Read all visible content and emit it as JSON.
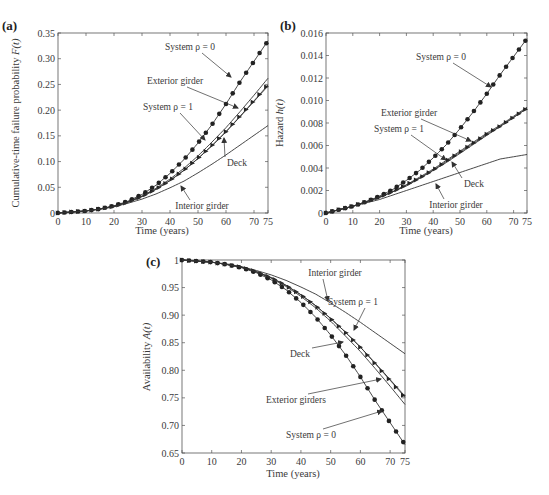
{
  "chart_data": [
    {
      "id": "a",
      "panel_label": "(a)",
      "type": "line",
      "title": "",
      "xlabel": "Time (years)",
      "ylabel": "Cumulative-time failure probability F(t)",
      "xlim": [
        0,
        75
      ],
      "ylim": [
        0,
        0.35
      ],
      "xticks": [
        0,
        10,
        20,
        30,
        40,
        50,
        60,
        70,
        75
      ],
      "yticks": [
        0,
        0.05,
        0.1,
        0.15,
        0.2,
        0.25,
        0.3,
        0.35
      ],
      "ytick_labels": [
        "0",
        "0.05",
        "0.10",
        "0.15",
        "0.20",
        "0.25",
        "0.30",
        "0.35"
      ],
      "grid": false,
      "x": [
        0,
        5,
        10,
        15,
        20,
        25,
        30,
        35,
        40,
        45,
        50,
        55,
        60,
        65,
        70,
        75
      ],
      "series": [
        {
          "name": "System ρ = 0",
          "marker": "circle",
          "values": [
            0,
            0.002,
            0.004,
            0.008,
            0.014,
            0.023,
            0.036,
            0.054,
            0.077,
            0.104,
            0.136,
            0.172,
            0.212,
            0.255,
            0.295,
            0.335
          ]
        },
        {
          "name": "Exterior girder",
          "marker": "none",
          "values": [
            0,
            0.002,
            0.004,
            0.008,
            0.013,
            0.022,
            0.033,
            0.048,
            0.066,
            0.087,
            0.111,
            0.138,
            0.166,
            0.197,
            0.229,
            0.262
          ]
        },
        {
          "name": "System ρ = 1",
          "marker": "triangle",
          "values": [
            0,
            0.002,
            0.004,
            0.008,
            0.013,
            0.021,
            0.032,
            0.046,
            0.063,
            0.083,
            0.106,
            0.131,
            0.158,
            0.188,
            0.218,
            0.249
          ]
        },
        {
          "name": "Deck",
          "marker": "none",
          "values": [
            0,
            0.002,
            0.004,
            0.008,
            0.013,
            0.021,
            0.032,
            0.046,
            0.063,
            0.083,
            0.106,
            0.131,
            0.158,
            0.187,
            0.217,
            0.247
          ]
        },
        {
          "name": "Interior girder",
          "marker": "none",
          "values": [
            0,
            0.002,
            0.004,
            0.007,
            0.012,
            0.019,
            0.027,
            0.037,
            0.049,
            0.062,
            0.078,
            0.095,
            0.113,
            0.132,
            0.151,
            0.17
          ]
        }
      ],
      "annotations": [
        {
          "text": "System ρ = 0",
          "tx": 190,
          "ty": 50,
          "ax": 231,
          "ay": 77
        },
        {
          "text": "Exterior girder",
          "tx": 175,
          "ty": 84,
          "ax": 238,
          "ay": 108
        },
        {
          "text": "System ρ = 1",
          "tx": 168,
          "ty": 110,
          "ax": 205,
          "ay": 140
        },
        {
          "text": "Deck",
          "tx": 237,
          "ty": 166,
          "ax": 224,
          "ay": 138
        },
        {
          "text": "Interior girder",
          "tx": 202,
          "ty": 209,
          "ax": 181,
          "ay": 186
        }
      ]
    },
    {
      "id": "b",
      "panel_label": "(b)",
      "type": "line",
      "title": "",
      "xlabel": "Time (years)",
      "ylabel": "Hazard h(t)",
      "xlim": [
        0,
        75
      ],
      "ylim": [
        0,
        0.016
      ],
      "xticks": [
        0,
        10,
        20,
        30,
        40,
        50,
        60,
        70,
        75
      ],
      "yticks": [
        0,
        0.002,
        0.004,
        0.006,
        0.008,
        0.01,
        0.012,
        0.014,
        0.016
      ],
      "ytick_labels": [
        "0",
        "0.002",
        "0.004",
        "0.006",
        "0.008",
        "0.010",
        "0.012",
        "0.014",
        "0.016"
      ],
      "grid": false,
      "x": [
        0,
        5,
        10,
        15,
        20,
        25,
        30,
        35,
        40,
        45,
        50,
        55,
        60,
        65,
        70,
        75
      ],
      "series": [
        {
          "name": "System ρ = 0",
          "marker": "circle",
          "values": [
            0,
            0.0003,
            0.0006,
            0.001,
            0.0015,
            0.0021,
            0.0029,
            0.0038,
            0.0049,
            0.0061,
            0.0075,
            0.009,
            0.0106,
            0.0123,
            0.0139,
            0.0155
          ]
        },
        {
          "name": "Exterior girder",
          "marker": "none",
          "values": [
            0,
            0.0003,
            0.0006,
            0.001,
            0.0014,
            0.0019,
            0.0025,
            0.0032,
            0.0039,
            0.0047,
            0.0055,
            0.0063,
            0.0071,
            0.0078,
            0.0086,
            0.0094
          ]
        },
        {
          "name": "System ρ = 1",
          "marker": "triangle",
          "values": [
            0,
            0.0003,
            0.0006,
            0.001,
            0.0014,
            0.0019,
            0.0025,
            0.0031,
            0.0038,
            0.0046,
            0.0054,
            0.0062,
            0.007,
            0.0077,
            0.0085,
            0.0093
          ]
        },
        {
          "name": "Deck",
          "marker": "none",
          "values": [
            0,
            0.0003,
            0.0006,
            0.001,
            0.0014,
            0.0019,
            0.0024,
            0.0031,
            0.0038,
            0.0045,
            0.0053,
            0.0061,
            0.0069,
            0.0077,
            0.0085,
            0.0093
          ]
        },
        {
          "name": "Interior girder",
          "marker": "none",
          "values": [
            0,
            0.0003,
            0.0006,
            0.0009,
            0.0012,
            0.0016,
            0.002,
            0.0024,
            0.0028,
            0.0032,
            0.0036,
            0.004,
            0.0044,
            0.0048,
            0.005,
            0.0052
          ]
        }
      ],
      "annotations": [
        {
          "text": "System ρ = 0",
          "tx": 441,
          "ty": 60,
          "ax": 491,
          "ay": 87
        },
        {
          "text": "Exterior girder",
          "tx": 409,
          "ty": 116,
          "ax": 471,
          "ay": 141
        },
        {
          "text": "System ρ = 1",
          "tx": 399,
          "ty": 132,
          "ax": 446,
          "ay": 160
        },
        {
          "text": "Deck",
          "tx": 474,
          "ty": 187,
          "ax": 452,
          "ay": 162
        },
        {
          "text": "Interior girder",
          "tx": 456,
          "ty": 208,
          "ax": 436,
          "ay": 184
        }
      ]
    },
    {
      "id": "c",
      "panel_label": "(c)",
      "type": "line",
      "title": "",
      "xlabel": "Time (years)",
      "ylabel": "Availability A(t)",
      "xlim": [
        0,
        75
      ],
      "ylim": [
        0.65,
        1.0
      ],
      "xticks": [
        0,
        10,
        20,
        30,
        40,
        50,
        60,
        70,
        75
      ],
      "yticks": [
        0.65,
        0.7,
        0.75,
        0.8,
        0.85,
        0.9,
        0.95,
        1.0
      ],
      "ytick_labels": [
        "0.65",
        "0.70",
        "0.75",
        "0.80",
        "0.85",
        "0.90",
        "0.95",
        "1"
      ],
      "grid": false,
      "x": [
        0,
        5,
        10,
        15,
        20,
        25,
        30,
        35,
        40,
        45,
        50,
        55,
        60,
        65,
        70,
        75
      ],
      "series": [
        {
          "name": "System ρ = 0",
          "marker": "circle",
          "values": [
            1.0,
            0.998,
            0.996,
            0.992,
            0.986,
            0.977,
            0.964,
            0.946,
            0.923,
            0.896,
            0.864,
            0.828,
            0.788,
            0.745,
            0.705,
            0.665
          ]
        },
        {
          "name": "Interior girder",
          "marker": "none",
          "values": [
            1.0,
            0.998,
            0.996,
            0.993,
            0.988,
            0.981,
            0.973,
            0.963,
            0.951,
            0.938,
            0.922,
            0.905,
            0.887,
            0.868,
            0.849,
            0.83
          ]
        },
        {
          "name": "System ρ = 1",
          "marker": "triangle",
          "values": [
            1.0,
            0.998,
            0.996,
            0.992,
            0.987,
            0.979,
            0.968,
            0.954,
            0.937,
            0.917,
            0.894,
            0.869,
            0.842,
            0.812,
            0.782,
            0.751
          ]
        },
        {
          "name": "Deck",
          "marker": "none",
          "values": [
            1.0,
            0.998,
            0.996,
            0.992,
            0.987,
            0.979,
            0.968,
            0.954,
            0.937,
            0.917,
            0.894,
            0.869,
            0.842,
            0.813,
            0.783,
            0.753
          ]
        },
        {
          "name": "Exterior girders",
          "marker": "none",
          "values": [
            1.0,
            0.998,
            0.996,
            0.992,
            0.987,
            0.978,
            0.967,
            0.952,
            0.934,
            0.913,
            0.889,
            0.862,
            0.834,
            0.803,
            0.771,
            0.738
          ]
        }
      ],
      "annotations": [
        {
          "text": "Interior girder",
          "tx": 335,
          "ty": 276,
          "ax": 328,
          "ay": 301
        },
        {
          "text": "System ρ = 1",
          "tx": 353,
          "ty": 305,
          "ax": 354,
          "ay": 330
        },
        {
          "text": "Deck",
          "tx": 300,
          "ty": 357,
          "ax": 343,
          "ay": 342
        },
        {
          "text": "Exterior girders",
          "tx": 296,
          "ty": 403,
          "ax": 381,
          "ay": 379
        },
        {
          "text": "System ρ = 0",
          "tx": 311,
          "ty": 438,
          "ax": 382,
          "ay": 411
        }
      ]
    }
  ],
  "panels": {
    "a": {
      "label": "(a)",
      "xlabel": "Time (years)",
      "ylabel_text": "Cumulative-time failure probability ",
      "ylabel_var": "F(t)"
    },
    "b": {
      "label": "(b)",
      "xlabel": "Time (years)",
      "ylabel_text": "Hazard ",
      "ylabel_var": "h(t)"
    },
    "c": {
      "label": "(c)",
      "xlabel": "Time (years)",
      "ylabel_text": "Availability ",
      "ylabel_var": "A(t)"
    }
  }
}
